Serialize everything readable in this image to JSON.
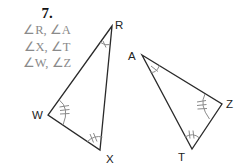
{
  "problem": {
    "number": "7.",
    "angle_pairs": [
      "∠R, ∠A",
      "∠X, ∠T",
      "∠W, ∠Z"
    ]
  },
  "figure": {
    "triangle_1": {
      "vertices": [
        {
          "label": "R",
          "x": 112,
          "y": 26,
          "angle_marks": 1
        },
        {
          "label": "W",
          "x": 48,
          "y": 115,
          "angle_marks": 3
        },
        {
          "label": "X",
          "x": 100,
          "y": 150,
          "angle_marks": 2
        }
      ]
    },
    "triangle_2": {
      "vertices": [
        {
          "label": "A",
          "x": 142,
          "y": 55,
          "angle_marks": 1
        },
        {
          "label": "Z",
          "x": 222,
          "y": 104,
          "angle_marks": 3
        },
        {
          "label": "T",
          "x": 192,
          "y": 149,
          "angle_marks": 2
        }
      ]
    },
    "colors": {
      "side": "#2a2a2a",
      "mark": "#8a8a8a",
      "heading": "#111111",
      "angle_text": "#8a8a8a"
    }
  }
}
